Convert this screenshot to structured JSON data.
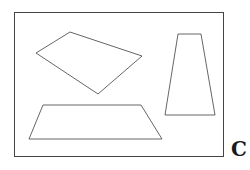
{
  "figure": {
    "label": "C",
    "stroke_color": "#555555",
    "frame": {
      "x": 14,
      "y": 12,
      "width": 209,
      "height": 144
    },
    "shapes": [
      {
        "name": "parallelogram",
        "points": "36,53 70,32 142,56 98,94"
      },
      {
        "name": "tall-trapezoid",
        "points": "178,34 201,34 215,115 165,115"
      },
      {
        "name": "wide-trapezoid",
        "points": "43,105 141,105 162,139 29,139"
      }
    ]
  }
}
